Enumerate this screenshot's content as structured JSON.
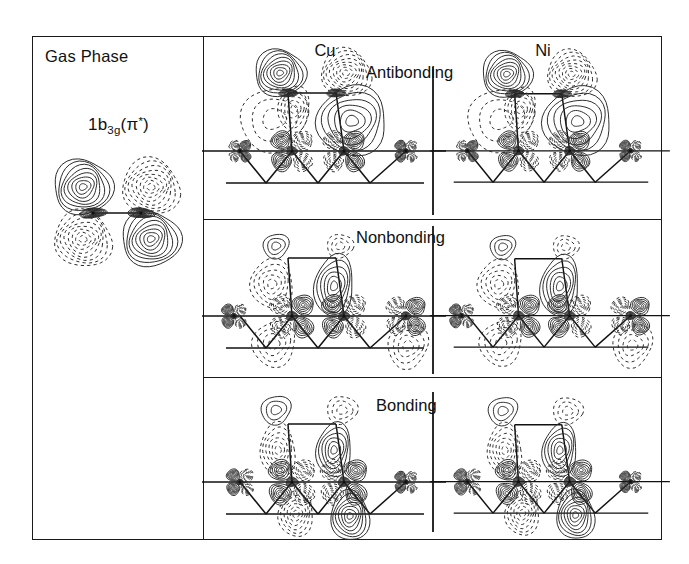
{
  "figure": {
    "gas_phase": {
      "title": "Gas Phase",
      "orbital_label_main": "1b",
      "orbital_label_sub": "3g",
      "orbital_label_paren_open": "(",
      "orbital_label_pi": "π",
      "orbital_label_star": "*",
      "orbital_label_paren_close": ")"
    },
    "columns": [
      {
        "label": "Cu",
        "name": "copper"
      },
      {
        "label": "Ni",
        "name": "nickel"
      }
    ],
    "rows": [
      {
        "label": "Antibonding"
      },
      {
        "label": "Nonbonding"
      },
      {
        "label": "Bonding"
      }
    ],
    "colors": {
      "ink": "#2b2b2b",
      "frame": "#1a1a1a",
      "background": "#ffffff"
    }
  },
  "chart_data": {
    "type": "contour",
    "row_categories": [
      "Antibonding",
      "Nonbonding",
      "Bonding"
    ],
    "column_categories": [
      "Cu",
      "Ni"
    ],
    "contour_style": {
      "solid_lines": "positive phase",
      "dashed_lines": "negative phase",
      "levels_per_lobe": 7
    },
    "gas_phase_panel": {
      "label": "1b3g(π*)",
      "lobes": [
        {
          "position": "upper-left",
          "phase": "positive",
          "style": "solid"
        },
        {
          "position": "upper-right",
          "phase": "negative",
          "style": "dashed"
        },
        {
          "position": "lower-left",
          "phase": "negative",
          "style": "dashed"
        },
        {
          "position": "lower-right",
          "phase": "positive",
          "style": "solid"
        }
      ],
      "adsorbate_atoms": 2
    },
    "cluster_model": {
      "adsorbate_atoms": 2,
      "surface_layer_atoms": 3,
      "second_layer_atoms": 2,
      "geometry": "two-atom adsorbate bridging atop two surface metal atoms of a two-layer metal cluster"
    }
  }
}
